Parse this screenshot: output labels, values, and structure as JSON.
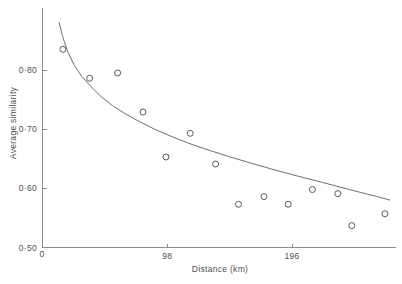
{
  "chart_data": {
    "type": "scatter",
    "title": "",
    "xlabel": "Distance (km)",
    "ylabel": "Average similarity",
    "xlim": [
      0,
      277
    ],
    "ylim": [
      0.5,
      0.86
    ],
    "grid": false,
    "legend": "none",
    "x_ticks": [
      {
        "value": 0,
        "label": "0"
      },
      {
        "value": 98,
        "label": "98"
      },
      {
        "value": 196,
        "label": "196"
      }
    ],
    "y_ticks": [
      {
        "value": 0.5,
        "label": "0·50"
      },
      {
        "value": 0.6,
        "label": "0·60"
      },
      {
        "value": 0.7,
        "label": "0·70"
      },
      {
        "value": 0.8,
        "label": "0·80"
      }
    ],
    "marker_style": "open-circle",
    "points": [
      {
        "x": 16,
        "y": 0.835
      },
      {
        "x": 37,
        "y": 0.786
      },
      {
        "x": 59,
        "y": 0.795
      },
      {
        "x": 79,
        "y": 0.729
      },
      {
        "x": 97,
        "y": 0.653
      },
      {
        "x": 116,
        "y": 0.693
      },
      {
        "x": 136,
        "y": 0.641
      },
      {
        "x": 154,
        "y": 0.573
      },
      {
        "x": 174,
        "y": 0.586
      },
      {
        "x": 193,
        "y": 0.573
      },
      {
        "x": 212,
        "y": 0.598
      },
      {
        "x": 232,
        "y": 0.591
      },
      {
        "x": 243,
        "y": 0.537
      },
      {
        "x": 269,
        "y": 0.557
      }
    ],
    "fit_curve": {
      "description": "decaying fitted trend line",
      "points": [
        {
          "x": 13,
          "y": 0.881
        },
        {
          "x": 16,
          "y": 0.855
        },
        {
          "x": 20,
          "y": 0.83
        },
        {
          "x": 25,
          "y": 0.808
        },
        {
          "x": 31,
          "y": 0.789
        },
        {
          "x": 38,
          "y": 0.772
        },
        {
          "x": 46,
          "y": 0.755
        },
        {
          "x": 55,
          "y": 0.74
        },
        {
          "x": 65,
          "y": 0.726
        },
        {
          "x": 76,
          "y": 0.713
        },
        {
          "x": 88,
          "y": 0.7
        },
        {
          "x": 101,
          "y": 0.688
        },
        {
          "x": 115,
          "y": 0.676
        },
        {
          "x": 130,
          "y": 0.665
        },
        {
          "x": 146,
          "y": 0.654
        },
        {
          "x": 163,
          "y": 0.643
        },
        {
          "x": 181,
          "y": 0.632
        },
        {
          "x": 200,
          "y": 0.621
        },
        {
          "x": 220,
          "y": 0.61
        },
        {
          "x": 241,
          "y": 0.598
        },
        {
          "x": 263,
          "y": 0.586
        },
        {
          "x": 273,
          "y": 0.58
        }
      ]
    }
  },
  "figure": {
    "origin_label": "0"
  }
}
